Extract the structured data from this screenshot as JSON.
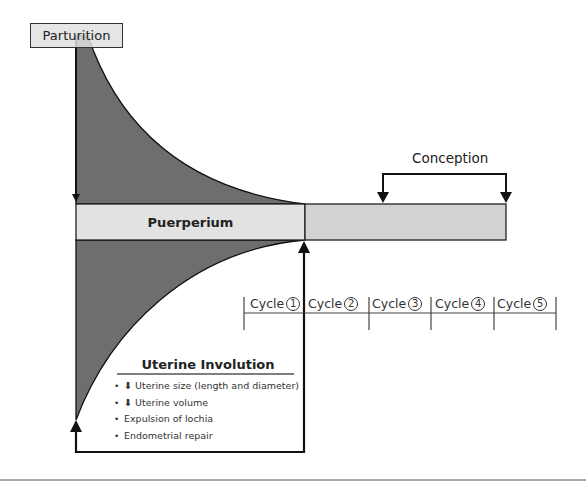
{
  "diagram": {
    "parturition": "Parturition",
    "puerperium": "Puerperium",
    "conception": "Conception",
    "cycles": [
      {
        "label": "Cycle",
        "num": "1"
      },
      {
        "label": "Cycle",
        "num": "2"
      },
      {
        "label": "Cycle",
        "num": "3"
      },
      {
        "label": "Cycle",
        "num": "4"
      },
      {
        "label": "Cycle",
        "num": "5"
      }
    ],
    "involution": {
      "title": "Uterine Involution",
      "items": [
        {
          "arrow": "⬇",
          "text": "Uterine size (length and diameter)"
        },
        {
          "arrow": "⬇",
          "text": "Uterine volume"
        },
        {
          "arrow": "",
          "text": "Expulsion of lochia"
        },
        {
          "arrow": "",
          "text": "Endometrial repair"
        }
      ]
    },
    "colors": {
      "dark_fill": "#6e6e6e",
      "band_fill": "#dcdcdc",
      "line": "#111111"
    }
  }
}
